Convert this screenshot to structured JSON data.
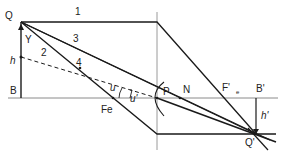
{
  "diagram": {
    "type": "optics ray diagram (eye lens image formation)",
    "labels": {
      "object_top": "Q",
      "object_base": "B",
      "object_height": "h",
      "angle_gamma": "Y",
      "ray_1": "1",
      "ray_2": "2",
      "ray_3": "3",
      "ray_4": "4",
      "front_focus": "Fe",
      "angle_u": "u",
      "angle_u_prime": "u'",
      "principal_point": "P",
      "nodal_point": "N",
      "rear_focus": "F'",
      "rear_focus_sub": "e",
      "image_base": "B'",
      "image_height": "h'",
      "image_top": "Q'"
    },
    "colors": {
      "line": "#1a1a1a",
      "axis": "#888888",
      "background": "#ffffff"
    }
  }
}
